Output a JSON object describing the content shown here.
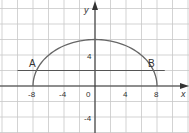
{
  "chart_data": {
    "type": "line",
    "title": "",
    "xlabel": "x",
    "ylabel": "y",
    "xlim": [
      -12,
      12
    ],
    "ylim": [
      -6,
      11
    ],
    "grid": true,
    "grid_step": 2,
    "x_ticks": [
      {
        "value": -8,
        "label": "-8"
      },
      {
        "value": -4,
        "label": "-4"
      },
      {
        "value": 0,
        "label": "0"
      },
      {
        "value": 4,
        "label": "4"
      },
      {
        "value": 8,
        "label": "8"
      }
    ],
    "y_ticks": [
      {
        "value": 4,
        "label": "4"
      },
      {
        "value": -4,
        "label": "-4"
      }
    ],
    "series": [
      {
        "name": "arc",
        "description": "upper half-ellipse through (-8,0), (0,6), (8,0)",
        "x": [
          -8,
          -6,
          -4,
          -2,
          0,
          2,
          4,
          6,
          8
        ],
        "y": [
          0,
          3.97,
          5.2,
          5.81,
          6,
          5.81,
          5.2,
          3.97,
          0
        ]
      },
      {
        "name": "chord AB",
        "description": "horizontal line y = 2",
        "x": [
          -10,
          9
        ],
        "y": [
          2,
          2
        ]
      }
    ],
    "annotations": [
      {
        "label": "A",
        "x": -7.5,
        "y": 2
      },
      {
        "label": "B",
        "x": 7.5,
        "y": 2
      }
    ]
  },
  "labels": {
    "x_axis": "x",
    "y_axis": "y",
    "point_a": "A",
    "point_b": "B",
    "tick_x_m8": "-8",
    "tick_x_m4": "-4",
    "tick_x_0": "0",
    "tick_x_4": "4",
    "tick_x_8": "8",
    "tick_y_4": "4",
    "tick_y_m4": "-4"
  },
  "colors": {
    "grid": "#c8c8c8",
    "axis": "#333333",
    "curve": "#555555"
  }
}
